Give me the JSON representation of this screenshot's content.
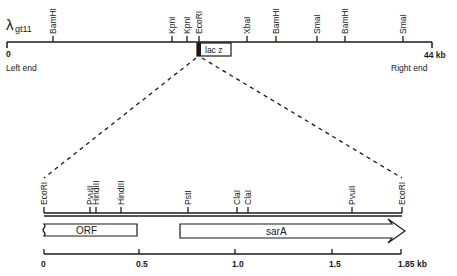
{
  "figure": {
    "top_map": {
      "phage_label": "λ",
      "phage_sub": "gt11",
      "start_label": "0",
      "end_label": "44 kb",
      "left_end": "Left end",
      "right_end": "Right end",
      "insert_label": "lac z",
      "sites": [
        {
          "name": "BamHI",
          "x": 53
        },
        {
          "name": "KpnI",
          "x": 172
        },
        {
          "name": "KpnI",
          "x": 187
        },
        {
          "name": "EcoRI",
          "x": 199
        },
        {
          "name": "XbaI",
          "x": 247
        },
        {
          "name": "BamHI",
          "x": 276
        },
        {
          "name": "SmaI",
          "x": 317
        },
        {
          "name": "BamHI",
          "x": 345
        },
        {
          "name": "SmaI",
          "x": 403
        }
      ]
    },
    "insert_map": {
      "sites": [
        {
          "name": "EcoRI",
          "x": 44
        },
        {
          "name": "PvuII",
          "x": 90
        },
        {
          "name": "HindIII",
          "x": 96
        },
        {
          "name": "HindIII",
          "x": 121
        },
        {
          "name": "PstI",
          "x": 188
        },
        {
          "name": "ClaI",
          "x": 237
        },
        {
          "name": "ClaI",
          "x": 248
        },
        {
          "name": "PvuII",
          "x": 352
        },
        {
          "name": "EcoRI",
          "x": 402
        }
      ],
      "orf_label": "ORF",
      "sara_label": "sarA"
    },
    "scale": {
      "ticks": [
        {
          "label": "0",
          "x": 44
        },
        {
          "label": "0.5",
          "x": 139
        },
        {
          "label": "1.0",
          "x": 235
        },
        {
          "label": "1.5",
          "x": 332
        },
        {
          "label": "1.85 kb",
          "x": 401
        }
      ]
    }
  }
}
